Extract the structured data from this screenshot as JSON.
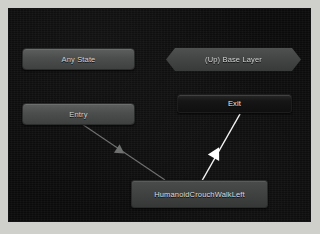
{
  "window": {
    "name": "Animator",
    "canvas_background": "#0b0b0b",
    "frame_background": "#cfd0cb"
  },
  "graph": {
    "nodes": [
      {
        "id": "any-state",
        "label": "Any State",
        "shape": "rounded-rect",
        "fill": "#4c4e4d",
        "text_color": "#d2d2d2",
        "selected": false
      },
      {
        "id": "base-layer",
        "label": "(Up) Base Layer",
        "shape": "chevron",
        "fill": "#424544",
        "text_color": "#d2d2d2",
        "selected": false
      },
      {
        "id": "entry",
        "label": "Entry",
        "shape": "rounded-rect",
        "fill": "#4c4e4d",
        "text_color": "#d2d2d2",
        "selected": false
      },
      {
        "id": "exit",
        "label": "Exit",
        "shape": "rounded-rect",
        "fill": "#151615",
        "text_color": "#e8e8e8",
        "selected": false
      },
      {
        "id": "clip-state",
        "label": "HumanoidCrouchWalkLeft",
        "shape": "rounded-rect",
        "fill": "#404241",
        "text_color": "#dcdcdc",
        "selected": true
      }
    ],
    "transitions": [
      {
        "id": "entry-to-clip",
        "from": "entry",
        "to": "clip-state",
        "color": "#6f7170",
        "selected": false,
        "arrow_direction": "down-right"
      },
      {
        "id": "clip-to-exit",
        "from": "clip-state",
        "to": "exit",
        "color": "#f2f2f2",
        "selected": true,
        "arrow_direction": "up-right"
      }
    ]
  }
}
